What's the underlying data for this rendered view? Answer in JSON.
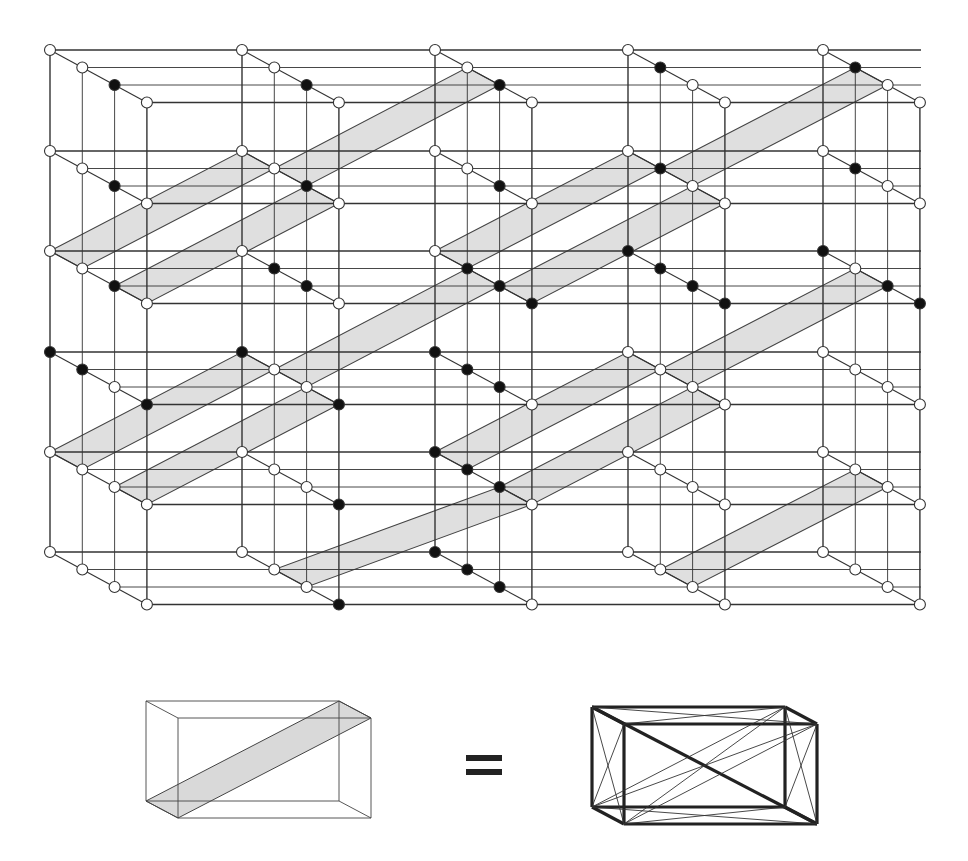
{
  "figure": {
    "colors": {
      "line": "#333333",
      "line_light": "#555555",
      "band_fill": "#d9d9d9",
      "band_stroke": "#444444",
      "node_open_fill": "#ffffff",
      "node_filled": "#111111"
    },
    "grid": {
      "col_x": [
        50,
        242,
        435,
        628,
        823
      ],
      "row_y": [
        50,
        151,
        251,
        352,
        452,
        552
      ],
      "depth_dx": 32.3,
      "depth_dy": 17.5,
      "depth_levels": 4,
      "right_edge_x": 921
    },
    "filled_nodes": [
      [
        [
          0,
          0,
          1,
          0
        ],
        [
          0,
          0,
          1,
          0
        ],
        [
          0,
          0,
          1,
          0
        ],
        [
          0,
          1,
          0,
          0
        ],
        [
          0,
          1,
          0,
          0
        ]
      ],
      [
        [
          0,
          0,
          1,
          0
        ],
        [
          0,
          0,
          1,
          0
        ],
        [
          0,
          0,
          1,
          0
        ],
        [
          0,
          1,
          0,
          0
        ],
        [
          0,
          1,
          0,
          0
        ]
      ],
      [
        [
          0,
          0,
          1,
          0
        ],
        [
          0,
          1,
          1,
          0
        ],
        [
          0,
          1,
          1,
          1
        ],
        [
          1,
          1,
          1,
          1
        ],
        [
          1,
          0,
          1,
          1
        ]
      ],
      [
        [
          1,
          1,
          0,
          1
        ],
        [
          1,
          0,
          0,
          1
        ],
        [
          1,
          1,
          1,
          0
        ],
        [
          0,
          0,
          0,
          0
        ],
        [
          0,
          0,
          0,
          0
        ]
      ],
      [
        [
          0,
          0,
          0,
          0
        ],
        [
          0,
          0,
          0,
          1
        ],
        [
          1,
          1,
          1,
          0
        ],
        [
          0,
          0,
          0,
          0
        ],
        [
          0,
          0,
          0,
          0
        ]
      ],
      [
        [
          0,
          0,
          0,
          0
        ],
        [
          0,
          0,
          0,
          1
        ],
        [
          1,
          1,
          1,
          0
        ],
        [
          0,
          0,
          0,
          0
        ],
        [
          0,
          0,
          0,
          0
        ]
      ]
    ],
    "bands": [
      {
        "from": [
          2,
          0,
          0
        ],
        "to": [
          1,
          1,
          0
        ]
      },
      {
        "from": [
          2,
          0,
          2
        ],
        "to": [
          1,
          1,
          2
        ]
      },
      {
        "from": [
          1,
          1,
          1
        ],
        "to": [
          0,
          2,
          1
        ]
      },
      {
        "from": [
          2,
          2,
          0
        ],
        "to": [
          1,
          3,
          0
        ]
      },
      {
        "from": [
          2,
          2,
          2
        ],
        "to": [
          1,
          3,
          2
        ]
      },
      {
        "from": [
          1,
          3,
          1
        ],
        "to": [
          0,
          4,
          1
        ]
      },
      {
        "from": [
          4,
          0,
          0
        ],
        "to": [
          3,
          1,
          0
        ]
      },
      {
        "from": [
          4,
          0,
          2
        ],
        "to": [
          3,
          1,
          2
        ]
      },
      {
        "from": [
          3,
          1,
          1
        ],
        "to": [
          2,
          2,
          1
        ]
      },
      {
        "from": [
          4,
          2,
          0
        ],
        "to": [
          3,
          3,
          0
        ]
      },
      {
        "from": [
          4,
          2,
          2
        ],
        "to": [
          3,
          3,
          2
        ]
      },
      {
        "from": [
          3,
          3,
          1
        ],
        "to": [
          2,
          4,
          1
        ]
      },
      {
        "from": [
          5,
          1,
          1
        ],
        "to": [
          4,
          2,
          2
        ]
      },
      {
        "from": [
          5,
          3,
          1
        ],
        "to": [
          4,
          4,
          1
        ]
      }
    ]
  },
  "legend": {
    "left_box": {
      "x": 146,
      "y": 701,
      "w": 193,
      "h": 100,
      "dx": 32,
      "dy": 17
    },
    "equals_label": "=",
    "right_box": {
      "x": 592,
      "y": 707,
      "w": 193,
      "h": 100,
      "dx": 32,
      "dy": 17
    }
  }
}
